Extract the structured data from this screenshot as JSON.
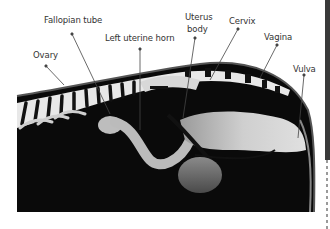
{
  "figure": {
    "labels": [
      {
        "id": "fallopian-tube",
        "text": "Fallopian tube",
        "x": 44,
        "y": 19
      },
      {
        "id": "left-uterine-horn",
        "text": "Left uterine horn",
        "x": 105,
        "y": 37
      },
      {
        "id": "ovary",
        "text": "Ovary",
        "x": 33,
        "y": 52
      },
      {
        "id": "uterus-body-line1",
        "text": "Uterus",
        "x": 185,
        "y": 13
      },
      {
        "id": "uterus-body-line2",
        "text": "body",
        "x": 187,
        "y": 25
      },
      {
        "id": "cervix",
        "text": "Cervix",
        "x": 229,
        "y": 18
      },
      {
        "id": "vagina",
        "text": "Vagina",
        "x": 264,
        "y": 32
      },
      {
        "id": "vulva",
        "text": "Vulva",
        "x": 294,
        "y": 66
      }
    ]
  }
}
